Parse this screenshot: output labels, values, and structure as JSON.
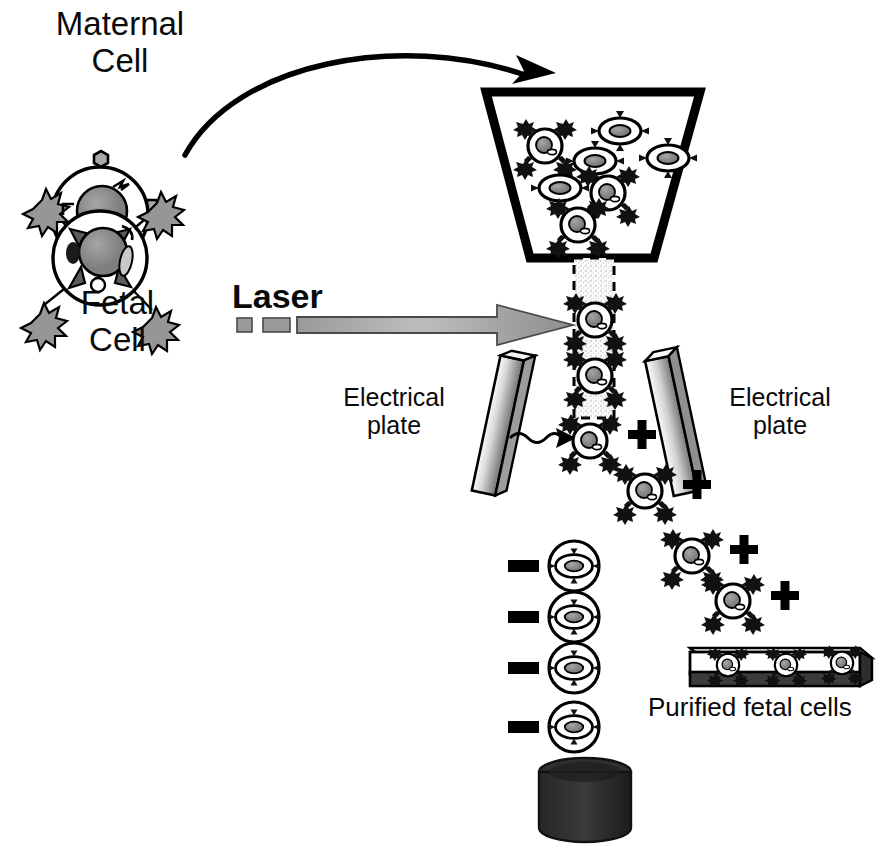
{
  "figure": {
    "type": "scientific-process-diagram"
  },
  "labels": {
    "maternal_cell": "Maternal\nCell",
    "fetal_cell": "Fetal\nCell",
    "laser": "Laser",
    "electrical_plate_left": "Electrical\nplate",
    "electrical_plate_right": "Electrical\nplate",
    "purified_fetal_cells": "Purified fetal cells"
  },
  "charges": {
    "positive_symbol": "+",
    "negative_symbol": "-",
    "positive_count": 4,
    "negative_count": 4
  },
  "colors": {
    "outline": "#000000",
    "nucleus_fill": "#8c8c8c",
    "plate_light": "#f2f2f2",
    "plate_dark": "#7d7d7d",
    "waste_fill": "#2b2b2b",
    "stream_fill": "#e2e2e2",
    "laser_arrow_light": "#b5b5b5",
    "laser_arrow_dark": "#8a8a8a",
    "background": "#ffffff"
  },
  "components": {
    "funnel": {
      "name": "sample-funnel",
      "cells_inside": 7,
      "fetal_inside": 3,
      "maternal_inside": 4
    },
    "stream": {
      "name": "fluid-stream",
      "cells_in_stream": 2,
      "dashed_outline": true
    },
    "laser": {
      "name": "laser-beam",
      "dashes": 2,
      "direction": "left-to-right"
    },
    "plates": {
      "left_tilt_deg": 12,
      "right_tilt_deg": -12
    },
    "collection_dish": {
      "name": "collection-dish",
      "cells": 3
    },
    "waste_container": {
      "name": "waste-container",
      "shape": "cylinder"
    }
  },
  "droplets": {
    "positive": [
      {
        "x": 590,
        "y": 441
      },
      {
        "x": 645,
        "y": 491
      },
      {
        "x": 692,
        "y": 556
      },
      {
        "x": 733,
        "y": 601
      }
    ],
    "negative": [
      {
        "x": 574,
        "y": 566
      },
      {
        "x": 574,
        "y": 617
      },
      {
        "x": 574,
        "y": 668
      },
      {
        "x": 574,
        "y": 727
      }
    ]
  }
}
